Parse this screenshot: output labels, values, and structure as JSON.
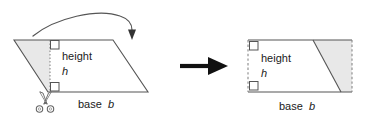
{
  "figure": {
    "background_color": "#ffffff",
    "stroke_color": "#555555",
    "shade_color": "#e8e8e8",
    "arrow_color": "#111111",
    "text_color": "#1a1a1a"
  },
  "left_shape": {
    "name": "parallelogram",
    "height_label": "height",
    "height_symbol": "h",
    "base_label": "base",
    "base_symbol": "b",
    "right_angle_marker_top": "right-angle",
    "right_angle_marker_bottom": "right-angle",
    "vertices": [
      [
        14,
        40
      ],
      [
        113,
        40
      ],
      [
        148,
        92
      ],
      [
        48,
        92
      ]
    ],
    "height_line_x": 50,
    "shaded_region": [
      [
        14,
        40
      ],
      [
        50,
        40
      ],
      [
        50,
        92
      ],
      [
        48,
        92
      ]
    ]
  },
  "right_shape": {
    "name": "rectangle",
    "height_label": "height",
    "height_symbol": "h",
    "base_label": "base",
    "base_symbol": "b",
    "right_angle_marker_top": "right-angle",
    "right_angle_marker_bottom": "right-angle",
    "bounds": [
      248,
      40,
      352,
      92
    ],
    "diagonal": [
      [
        313,
        40
      ],
      [
        341,
        92
      ]
    ],
    "shaded_region": [
      [
        313,
        40
      ],
      [
        352,
        40
      ],
      [
        352,
        92
      ],
      [
        341,
        92
      ]
    ]
  },
  "annotations": {
    "curved_arrow": "rotate-cut-piece-arrow",
    "transform_arrow": "becomes-arrow",
    "scissors": "scissors-cut-icon"
  }
}
